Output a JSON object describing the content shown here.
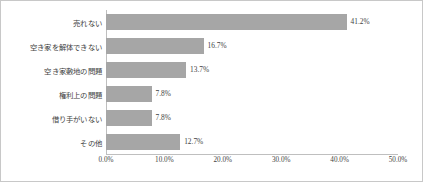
{
  "chart_data": {
    "type": "bar",
    "orientation": "horizontal",
    "title": "",
    "subtitle": "",
    "xlabel": "",
    "ylabel": "",
    "grid": false,
    "legend": null,
    "xlim": [
      0,
      50
    ],
    "xtick_labels": [
      "0.0%",
      "10.0%",
      "20.0%",
      "30.0%",
      "40.0%",
      "50.0%"
    ],
    "xtick_values": [
      0,
      10,
      20,
      30,
      40,
      50
    ],
    "categories": [
      "売れない",
      "空き家を解体できない",
      "空き家敷地の問題",
      "権利上の問題",
      "借り手がいない",
      "その他"
    ],
    "values": [
      41.2,
      16.7,
      13.7,
      7.8,
      7.8,
      12.7
    ],
    "value_labels": [
      "41.2%",
      "16.7%",
      "13.7%",
      "7.8%",
      "7.8%",
      "12.7%"
    ],
    "series": [
      {
        "name": "",
        "values": [
          41.2,
          16.7,
          13.7,
          7.8,
          7.8,
          12.7
        ]
      }
    ],
    "colors": {
      "bar": "#a6a6a6",
      "text": "#3f3f3f",
      "axis": "#bfbfbf",
      "border": "#c8c8c8",
      "background": "#ffffff"
    }
  }
}
